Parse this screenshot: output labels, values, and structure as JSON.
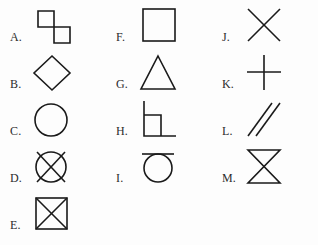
{
  "figure": {
    "stroke_color": "#1a1a1a",
    "background_color": "#fdfdfd",
    "columns": [
      {
        "name": "column-1",
        "items": [
          {
            "label": "A.",
            "shape": "s-tetromino-offset-squares"
          },
          {
            "label": "B.",
            "shape": "diamond"
          },
          {
            "label": "C.",
            "shape": "circle"
          },
          {
            "label": "D.",
            "shape": "circle-with-x"
          },
          {
            "label": "E.",
            "shape": "square-with-x"
          }
        ]
      },
      {
        "name": "column-2",
        "items": [
          {
            "label": "F.",
            "shape": "square"
          },
          {
            "label": "G.",
            "shape": "triangle"
          },
          {
            "label": "H.",
            "shape": "square-with-extended-corners"
          },
          {
            "label": "I.",
            "shape": "circle-with-top-bar"
          }
        ]
      },
      {
        "name": "column-3",
        "items": [
          {
            "label": "J.",
            "shape": "x-cross"
          },
          {
            "label": "K.",
            "shape": "plus"
          },
          {
            "label": "L.",
            "shape": "double-diagonal-lines"
          },
          {
            "label": "M.",
            "shape": "bowtie-hourglass"
          }
        ]
      }
    ]
  }
}
